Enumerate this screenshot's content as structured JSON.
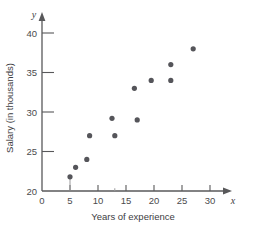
{
  "chart_data": {
    "type": "scatter",
    "title": "",
    "xlabel": "Years of experience",
    "ylabel": "Salary (in thousands)",
    "x_axis_variable": "x",
    "y_axis_variable": "y",
    "xlim": [
      0,
      32.5
    ],
    "ylim": [
      20,
      41
    ],
    "xticks": [
      0,
      5,
      10,
      15,
      20,
      25,
      30
    ],
    "yticks": [
      20,
      25,
      30,
      35,
      40
    ],
    "xtick_labels": [
      "0",
      "5",
      "10",
      "15",
      "20",
      "25",
      "30"
    ],
    "ytick_labels": [
      "20",
      "25",
      "30",
      "35",
      "40"
    ],
    "grid": false,
    "legend": null,
    "marker_color": "#55555a",
    "axis_color": "#58585a",
    "points": [
      {
        "x": 5,
        "y": 21.8
      },
      {
        "x": 6,
        "y": 23
      },
      {
        "x": 8,
        "y": 24
      },
      {
        "x": 8.5,
        "y": 27
      },
      {
        "x": 12.5,
        "y": 29.2
      },
      {
        "x": 13,
        "y": 27
      },
      {
        "x": 16.5,
        "y": 33
      },
      {
        "x": 17,
        "y": 29
      },
      {
        "x": 19.5,
        "y": 34
      },
      {
        "x": 23,
        "y": 34
      },
      {
        "x": 23,
        "y": 36
      },
      {
        "x": 27,
        "y": 38
      }
    ],
    "drop_lines": [
      {
        "x": 5,
        "y_top": 21.8
      },
      {
        "x": 13,
        "y_top": 20.6
      }
    ]
  }
}
